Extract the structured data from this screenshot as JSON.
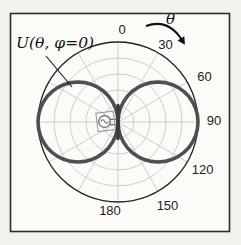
{
  "figure": {
    "pattern_label": "U(θ, φ=0)",
    "angle_axis_label": "θ"
  },
  "colors": {
    "page_bg": "#f2f1ed",
    "panel_bg": "#fcfbf8",
    "frame_stroke": "#2b2b2b",
    "grid": "#c8c8c8",
    "outer_circle": "#222222",
    "pattern_stroke": "#4f4f4f",
    "icon_stroke": "#6e6e6e",
    "icon_box_stroke": "#9a9a9a",
    "annotation": "#111111",
    "text": "#1c1c1c"
  },
  "chart_data": {
    "type": "line",
    "subtype": "polar-radiation-pattern",
    "title": "U(θ, φ=0)",
    "angle_axis_label": "θ",
    "angle_unit": "degrees",
    "zero_location": "top",
    "direction": "clockwise",
    "angle_ticks_deg": [
      0,
      30,
      60,
      90,
      120,
      150,
      180
    ],
    "tick_labels": [
      "0",
      "30",
      "60",
      "90",
      "120",
      "150",
      "180"
    ],
    "radial_gridline_fractions": [
      0.2,
      0.4,
      0.6,
      0.8,
      1.0
    ],
    "spoke_step_deg": 30,
    "pattern_description": "normalized dipole radiation intensity, figure-eight lobes tangent at origin, maxima at θ=90° and θ=270°",
    "series": [
      {
        "name": "U(θ, φ=0)",
        "theta_start_deg": 0,
        "theta_step_deg": 5,
        "symmetry": "r(360−θ)=r(θ)",
        "r_normalized": [
          0.0,
          0.087,
          0.174,
          0.259,
          0.342,
          0.423,
          0.5,
          0.574,
          0.643,
          0.707,
          0.766,
          0.819,
          0.866,
          0.906,
          0.94,
          0.966,
          0.985,
          0.996,
          1.0,
          0.996,
          0.985,
          0.966,
          0.94,
          0.906,
          0.866,
          0.819,
          0.766,
          0.707,
          0.643,
          0.574,
          0.5,
          0.423,
          0.342,
          0.259,
          0.174,
          0.087,
          0.0
        ]
      }
    ],
    "layout": {
      "cx": 118,
      "cy": 122,
      "radius": 80,
      "frame": {
        "x": 10.5,
        "y": 13.5,
        "w": 219,
        "h": 218
      },
      "tick_label_radius": 93,
      "tick_label_offsets": [
        [
          4,
          0
        ],
        [
          1,
          3
        ],
        [
          6,
          1
        ],
        [
          3,
          -2
        ],
        [
          4,
          1
        ],
        [
          3,
          3
        ],
        [
          -8,
          -5
        ]
      ],
      "leader_line": {
        "x1": 46,
        "y1": 56,
        "x2": 72,
        "y2": 87
      },
      "direction_arrow": {
        "x1": 146,
        "y1": 26,
        "qx": 168,
        "qy": 18,
        "x2": 182,
        "y2": 40
      }
    }
  }
}
